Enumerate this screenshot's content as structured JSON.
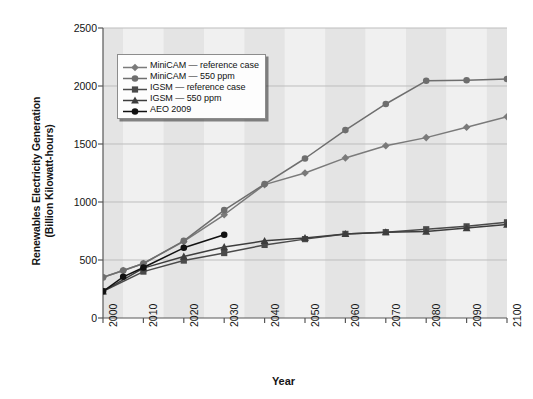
{
  "chart_data": {
    "type": "line",
    "title": "",
    "xlabel": "Year",
    "ylabel": "Renewables Electricity Generation (Billion Kilowatt-hours)",
    "ylabel_line1": "Renewables Electricity Generation",
    "ylabel_line2": "(Billion Kilowatt-hours)",
    "xlim": [
      2000,
      2100
    ],
    "ylim": [
      0,
      2500
    ],
    "xticks": [
      "2000",
      "2010",
      "2020",
      "2030",
      "2040",
      "2050",
      "2060",
      "2070",
      "2080",
      "2090",
      "2100"
    ],
    "yticks": [
      "0",
      "500",
      "1000",
      "1500",
      "2000",
      "2500"
    ],
    "grid": "horizontal",
    "legend_position": "upper-left-inside",
    "background_bands": "alternating vertical light gray bands",
    "series": [
      {
        "name": "MiniCAM — reference case",
        "marker": "diamond",
        "color": "#7a7a7a",
        "x": [
          2000,
          2005,
          2010,
          2020,
          2030,
          2040,
          2050,
          2060,
          2070,
          2080,
          2090,
          2100
        ],
        "values": [
          350,
          410,
          470,
          660,
          890,
          1150,
          1250,
          1380,
          1485,
          1555,
          1645,
          1735
        ]
      },
      {
        "name": "MiniCAM — 550 ppm",
        "marker": "circle",
        "color": "#6e6e6e",
        "x": [
          2000,
          2005,
          2010,
          2020,
          2030,
          2040,
          2050,
          2060,
          2070,
          2080,
          2090,
          2100
        ],
        "values": [
          350,
          410,
          470,
          665,
          930,
          1155,
          1375,
          1620,
          1845,
          2045,
          2050,
          2060
        ]
      },
      {
        "name": "IGSM — reference case",
        "marker": "square",
        "color": "#4a4a4a",
        "x": [
          2000,
          2010,
          2020,
          2030,
          2040,
          2050,
          2060,
          2070,
          2080,
          2090,
          2100
        ],
        "values": [
          230,
          400,
          495,
          560,
          630,
          680,
          725,
          740,
          765,
          790,
          825
        ]
      },
      {
        "name": "IGSM — 550 ppm",
        "marker": "triangle",
        "color": "#3d3d3d",
        "x": [
          2000,
          2010,
          2020,
          2030,
          2040,
          2050,
          2060,
          2070,
          2080,
          2090,
          2100
        ],
        "values": [
          230,
          430,
          530,
          612,
          665,
          690,
          725,
          740,
          745,
          775,
          805
        ]
      },
      {
        "name": "AEO 2009",
        "marker": "circle-filled",
        "color": "#111111",
        "x": [
          2000,
          2005,
          2010,
          2020,
          2030
        ],
        "values": [
          230,
          355,
          435,
          605,
          718
        ]
      }
    ]
  },
  "axes": {
    "x_title": "Year",
    "y_title_line1": "Renewables Electricity Generation",
    "y_title_line2": "(Billion Kilowatt-hours)"
  },
  "legend": {
    "items": [
      {
        "label": "MiniCAM — reference case",
        "marker": "diamond"
      },
      {
        "label": "MiniCAM — 550 ppm",
        "marker": "circle"
      },
      {
        "label": "IGSM — reference case",
        "marker": "square"
      },
      {
        "label": "IGSM — 550 ppm",
        "marker": "triangle"
      },
      {
        "label": "AEO 2009",
        "marker": "circle-filled"
      }
    ]
  },
  "colors": {
    "plot_background": "#ebebeb",
    "band_light": "#f0f0f0",
    "band_dark": "#e4e4e4",
    "gridline": "#bdbdbd",
    "axis": "#585858",
    "text": "#141414"
  }
}
